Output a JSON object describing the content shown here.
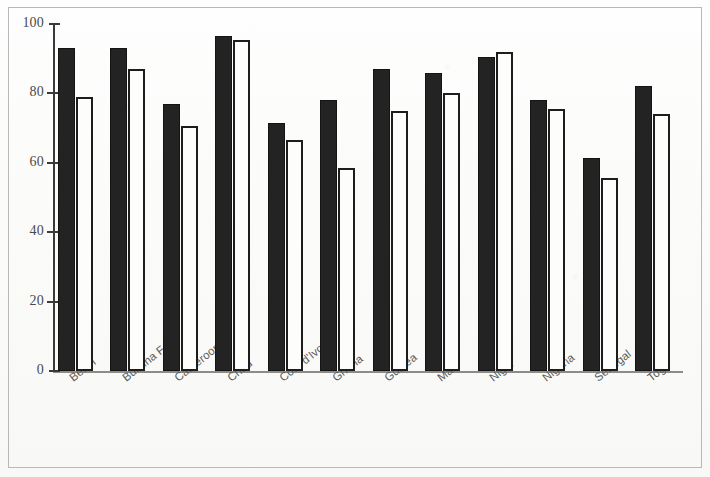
{
  "chart_data": {
    "type": "bar",
    "title": "",
    "subtitle": "",
    "xlabel": "",
    "ylabel": "",
    "ylim": [
      0,
      100
    ],
    "y_ticks": [
      0,
      20,
      40,
      60,
      80,
      100
    ],
    "grid": false,
    "legend_position": "none",
    "categories": [
      "Benin",
      "Burkina Faso",
      "Cameroon",
      "Chad",
      "Cote d'Ivoire",
      "Ghana",
      "Guinea",
      "Mali",
      "Niger",
      "Nigeria",
      "Senegal",
      "Togo"
    ],
    "series": [
      {
        "name": "series-1",
        "style": "filled-black",
        "color": "#232323",
        "values": [
          93,
          93,
          77,
          96.5,
          71.5,
          78,
          87,
          86,
          90.5,
          78,
          61.5,
          82
        ]
      },
      {
        "name": "series-2",
        "style": "hollow-white",
        "color": "#ffffff",
        "edge_color": "#1d1d1d",
        "values": [
          79,
          87,
          70.5,
          95.5,
          66.5,
          58.5,
          75,
          80,
          92,
          75.5,
          55.5,
          74
        ]
      }
    ]
  },
  "axes": {
    "y_tick_labels": [
      "100",
      "80",
      "60",
      "40",
      "20",
      "0"
    ]
  }
}
